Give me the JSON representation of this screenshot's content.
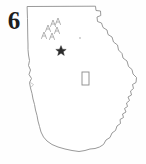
{
  "figure": {
    "number_label": "6",
    "caption": "",
    "background_color": "#ffffff",
    "width": 146,
    "height": 164
  },
  "map": {
    "subject": "Georgia state outline",
    "style": "hand-drawn faint photocopy line map",
    "outline_color": "#8d8d8d",
    "fill_color": "#ffffff",
    "borders": {
      "north": "straight horizontal line",
      "east": "stepped river border then irregular coastline",
      "south": "mostly straight with slight bends",
      "west": "wavy river border"
    }
  },
  "symbols": {
    "capital_marker": {
      "name": "star",
      "color": "#2b2b2b",
      "x": 61,
      "y": 50
    },
    "mountain_marks": {
      "name": "caret-triangles",
      "color": "#9a9a9a",
      "count": 6,
      "points": [
        {
          "x": 44,
          "y": 35
        },
        {
          "x": 48,
          "y": 28
        },
        {
          "x": 52,
          "y": 36
        },
        {
          "x": 53,
          "y": 23
        },
        {
          "x": 57,
          "y": 30
        },
        {
          "x": 58,
          "y": 21
        }
      ]
    },
    "site_rectangle": {
      "name": "rectangle",
      "color": "#8a8a8a",
      "x": 82,
      "y": 72,
      "width": 7,
      "height": 13
    },
    "corner_mark": {
      "name": "faint-corner-glyph",
      "label": "",
      "x": 27,
      "y": 7
    },
    "faint_dot": {
      "x": 80,
      "y": 38,
      "color": "#c2c2c2"
    }
  }
}
